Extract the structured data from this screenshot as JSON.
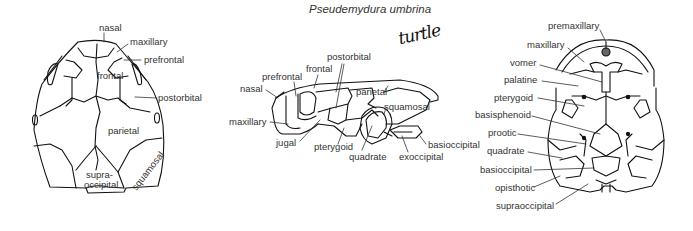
{
  "title": "Pseudemydura umbrina",
  "handwritten_note": "turtle",
  "views": {
    "dorsal": {
      "labels": {
        "nasal": "nasal",
        "maxillary": "maxillary",
        "prefrontal": "prefrontal",
        "frontal": "frontal",
        "postorbital": "postorbital",
        "parietal": "parietal",
        "supraoccipital_1": "supra-",
        "supraoccipital_2": "occipital",
        "squamosal": "squamosal"
      }
    },
    "lateral": {
      "labels": {
        "postorbital": "postorbital",
        "frontal": "frontal",
        "prefrontal": "prefrontal",
        "nasal": "nasal",
        "parietal": "parietal",
        "squamosal": "squamosal",
        "maxillary": "maxillary",
        "jugal": "jugal",
        "pterygoid": "pterygoid",
        "quadrate": "quadrate",
        "exoccipital": "exoccipital",
        "basioccipital": "basioccipital"
      }
    },
    "ventral": {
      "labels": {
        "premaxillary": "premaxillary",
        "maxillary": "maxillary",
        "vomer": "vomer",
        "palatine": "palatine",
        "pterygoid": "pterygoid",
        "basisphenoid": "basisphenoid",
        "prootic": "prootic",
        "quadrate": "quadrate",
        "basioccipital": "basioccipital",
        "opisthotic": "opisthotic",
        "supraoccipital": "supraoccipital"
      }
    }
  }
}
